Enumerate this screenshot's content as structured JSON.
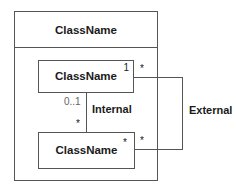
{
  "diagram": {
    "type": "UML class diagram",
    "outer_class": {
      "name": "ClassName"
    },
    "inner_classes": [
      {
        "name": "ClassName",
        "multiplicity_corner": "1"
      },
      {
        "name": "ClassName",
        "multiplicity_corner": "*"
      }
    ],
    "associations": [
      {
        "label": "Internal",
        "source_multiplicity": "0..1",
        "target_multiplicity": "*"
      },
      {
        "label": "External",
        "source_multiplicity": "*",
        "target_multiplicity": "*"
      }
    ]
  }
}
